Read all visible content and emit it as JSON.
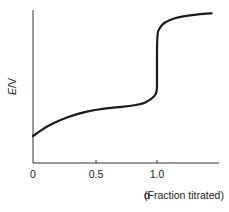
{
  "chart_data": {
    "type": "line",
    "title": "",
    "xlabel": "α (Fraction titrated)",
    "ylabel": "E/V",
    "ylabel_parts": {
      "symbol": "E",
      "unit": "/V"
    },
    "x_ticks": [
      "0",
      "0.5",
      "1.0"
    ],
    "x_tick_values": [
      0,
      0.5,
      1.0
    ],
    "xlim": [
      0,
      1.5
    ],
    "y_ticks": [],
    "grid": false,
    "legend": null,
    "series": [
      {
        "name": "Titration curve",
        "color": "#1a1a1a",
        "x": [
          0,
          0.1,
          0.22,
          0.35,
          0.5,
          0.65,
          0.78,
          0.88,
          0.93,
          0.97,
          1.0,
          1.0,
          1.0,
          1.02,
          1.06,
          1.15,
          1.25,
          1.35,
          1.44
        ],
        "y": [
          0.0,
          0.12,
          0.22,
          0.3,
          0.36,
          0.39,
          0.41,
          0.44,
          0.48,
          0.53,
          0.59,
          0.8,
          1.39,
          1.48,
          1.56,
          1.62,
          1.65,
          1.67,
          1.68
        ]
      }
    ]
  },
  "axes": {
    "x_tick_labels": [
      "0",
      "0.5",
      "1.0"
    ],
    "x_title_alpha": "α",
    "x_title_rest": " (Fraction titrated)",
    "y_title_symbol": "E",
    "y_title_unit": "/V"
  }
}
